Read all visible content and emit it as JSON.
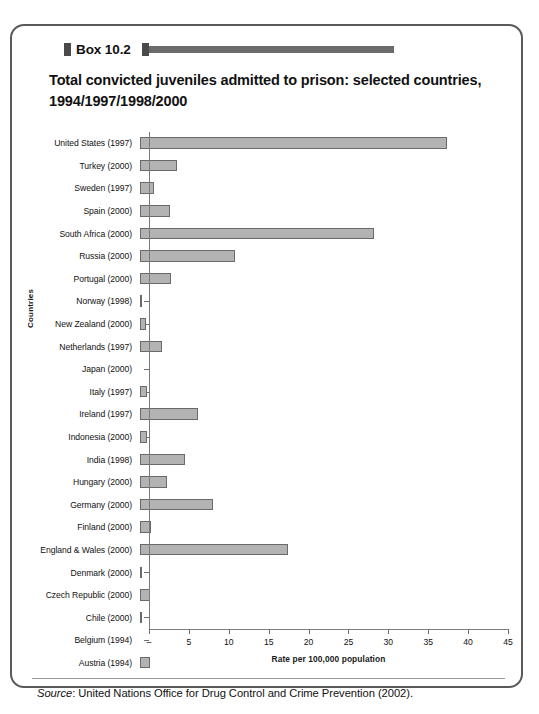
{
  "box": {
    "header_label": "Box 10.2",
    "title": "Total convicted juveniles admitted to prison: selected countries, 1994/1997/1998/2000",
    "source_prefix": "Source",
    "source_text": ": United Nations Office for Drug Control and Crime Prevention (2002)."
  },
  "colors": {
    "bar_fill": "#b3b3b3",
    "bar_stroke": "#6a6a6a",
    "axis": "#7a7a7a",
    "box_border": "#5a5a5a",
    "header_rule": "#6b6b6b"
  },
  "chart_data": {
    "type": "bar",
    "orientation": "horizontal",
    "title": "Total convicted juveniles admitted to prison: selected countries, 1994/1997/1998/2000",
    "xlabel": "Rate per 100,000 population",
    "ylabel": "Countries",
    "xlim": [
      0,
      45
    ],
    "xticks": [
      0,
      5,
      10,
      15,
      20,
      25,
      30,
      35,
      40,
      45
    ],
    "xticklabels": [
      "–",
      "5",
      "10",
      "15",
      "20",
      "25",
      "30",
      "35",
      "40",
      "45"
    ],
    "grid": false,
    "legend": null,
    "categories": [
      "United States (1997)",
      "Turkey (2000)",
      "Sweden (1997)",
      "Spain (2000)",
      "South Africa (2000)",
      "Russia (2000)",
      "Portugal (2000)",
      "Norway (1998)",
      "New Zealand (2000)",
      "Netherlands (1997)",
      "Japan (2000)",
      "Italy (1997)",
      "Ireland (1997)",
      "Indonesia (2000)",
      "India (1998)",
      "Hungary (2000)",
      "Germany (2000)",
      "Finland (2000)",
      "England & Wales (2000)",
      "Denmark (2000)",
      "Czech Republic (2000)",
      "Chile (2000)",
      "Belgium (1994)",
      "Austria (1994)"
    ],
    "values": [
      38.5,
      4.6,
      1.7,
      3.7,
      29.3,
      11.9,
      3.9,
      0.15,
      0.7,
      2.8,
      0.0,
      0.9,
      7.3,
      0.9,
      5.6,
      3.4,
      9.2,
      1.4,
      18.5,
      0.2,
      1.3,
      0.2,
      0.0,
      1.2
    ]
  }
}
